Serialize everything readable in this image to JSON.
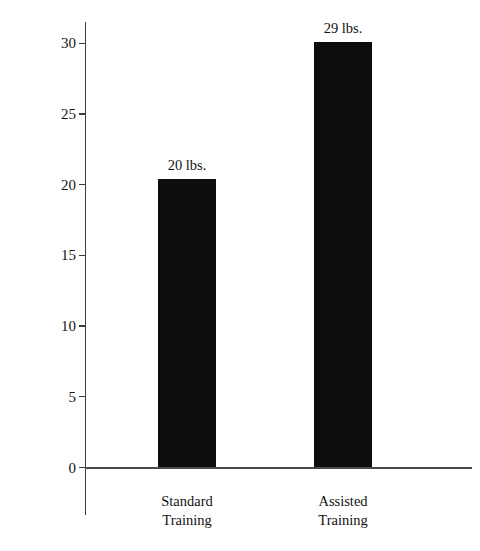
{
  "chart_data": {
    "type": "bar",
    "title": "",
    "xlabel": "",
    "ylabel": "Weightload Increase (Pounds)",
    "categories": [
      "Standard Training",
      "Assisted Training"
    ],
    "category_lines": [
      [
        "Standard",
        "Training"
      ],
      [
        "Assisted",
        "Training"
      ]
    ],
    "values": [
      20.4,
      30.1
    ],
    "data_labels": [
      "20 lbs.",
      "29 lbs."
    ],
    "ylim": [
      0,
      31.5
    ],
    "yticks": [
      0,
      5,
      10,
      15,
      20,
      25,
      30
    ],
    "ytick_labels": [
      "0",
      "5",
      "10",
      "15",
      "20",
      "25",
      "30"
    ],
    "grid": false,
    "legend": false,
    "bar_color": "#0d0d0d",
    "axis_color": "#3d3d3d",
    "background_color": "#ffffff"
  }
}
